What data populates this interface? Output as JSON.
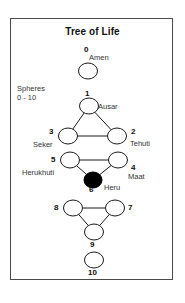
{
  "figure": {
    "title": "Tree of Life",
    "legend": {
      "line1": "Spheres",
      "line2": "0 - 10"
    },
    "frame_color": "#4a4a4a",
    "node_stroke_color": "#1a1a1a",
    "node_fill_color": "#ffffff",
    "filled_node_color": "#000000",
    "edge_color": "#1a1a1a"
  },
  "chart_data": {
    "type": "diagram",
    "title": "Tree of Life",
    "nodes": [
      {
        "id": "0",
        "number": "0",
        "name": "Amen",
        "cx": 88,
        "cy": 71,
        "rx": 9.5,
        "ry": 8.0,
        "filled": false,
        "num_x": 84,
        "num_y": 46,
        "name_x": 89,
        "name_y": 54
      },
      {
        "id": "1",
        "number": "1",
        "name": "Ausar",
        "cx": 89,
        "cy": 106,
        "rx": 9.5,
        "ry": 8.0,
        "filled": false,
        "num_x": 85,
        "num_y": 90,
        "name_x": 98,
        "name_y": 103
      },
      {
        "id": "3",
        "number": "3",
        "name": "Seker",
        "cx": 68,
        "cy": 136,
        "rx": 9.5,
        "ry": 8.0,
        "filled": false,
        "num_x": 49,
        "num_y": 128,
        "name_x": 33,
        "name_y": 141
      },
      {
        "id": "2",
        "number": "2",
        "name": "Tehuti",
        "cx": 117,
        "cy": 136,
        "rx": 9.5,
        "ry": 8.0,
        "filled": false,
        "num_x": 131,
        "num_y": 128,
        "name_x": 130,
        "name_y": 140
      },
      {
        "id": "5",
        "number": "5",
        "name": "Herukhuti",
        "cx": 70,
        "cy": 160,
        "rx": 9.5,
        "ry": 8.0,
        "filled": false,
        "num_x": 51,
        "num_y": 156,
        "name_x": 22,
        "name_y": 169
      },
      {
        "id": "4",
        "number": "4",
        "name": "Maat",
        "cx": 118,
        "cy": 160,
        "rx": 9.5,
        "ry": 8.0,
        "filled": false,
        "num_x": 131,
        "num_y": 164,
        "name_x": 128,
        "name_y": 173
      },
      {
        "id": "6",
        "number": "6",
        "name": "Heru",
        "cx": 93,
        "cy": 180,
        "rx": 9.0,
        "ry": 8.0,
        "filled": true,
        "num_x": 89,
        "num_y": 186,
        "name_x": 104,
        "name_y": 184
      },
      {
        "id": "8",
        "number": "8",
        "name": "",
        "cx": 73,
        "cy": 208,
        "rx": 9.5,
        "ry": 8.0,
        "filled": false,
        "num_x": 54,
        "num_y": 204,
        "name_x": 0,
        "name_y": 0
      },
      {
        "id": "7",
        "number": "7",
        "name": "",
        "cx": 115,
        "cy": 208,
        "rx": 9.5,
        "ry": 8.0,
        "filled": false,
        "num_x": 128,
        "num_y": 204,
        "name_x": 0,
        "name_y": 0
      },
      {
        "id": "9",
        "number": "9",
        "name": "",
        "cx": 94,
        "cy": 232,
        "rx": 9.5,
        "ry": 8.0,
        "filled": false,
        "num_x": 90,
        "num_y": 241,
        "name_x": 0,
        "name_y": 0
      },
      {
        "id": "10",
        "number": "10",
        "name": "",
        "cx": 94,
        "cy": 260,
        "rx": 9.5,
        "ry": 8.0,
        "filled": false,
        "num_x": 88,
        "num_y": 269,
        "name_x": 0,
        "name_y": 0
      }
    ],
    "edges": [
      {
        "from": "1",
        "to": "3"
      },
      {
        "from": "1",
        "to": "2"
      },
      {
        "from": "3",
        "to": "2"
      },
      {
        "from": "5",
        "to": "4"
      },
      {
        "from": "5",
        "to": "6"
      },
      {
        "from": "4",
        "to": "6"
      },
      {
        "from": "8",
        "to": "7"
      },
      {
        "from": "8",
        "to": "9"
      },
      {
        "from": "7",
        "to": "9"
      }
    ]
  }
}
